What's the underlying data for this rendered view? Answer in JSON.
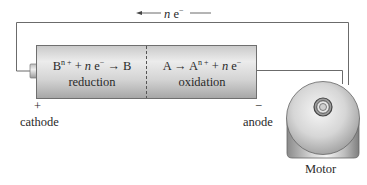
{
  "electron_flow": {
    "label_n": "n",
    "label_e": "e",
    "label_sup": "−",
    "direction": "right-to-left"
  },
  "battery": {
    "cathode_half": {
      "equation": {
        "species": "B",
        "charge_sup": "n +",
        "plus": "+",
        "n": "n",
        "e": "e",
        "e_sup": "−",
        "product": "B"
      },
      "process": "reduction"
    },
    "anode_half": {
      "equation": {
        "reactant": "A",
        "product": "A",
        "charge_sup": "n +",
        "plus": "+",
        "n": "n",
        "e": "e",
        "e_sup": "−"
      },
      "process": "oxidation"
    }
  },
  "terminals": {
    "cathode": {
      "sign": "+",
      "label": "cathode"
    },
    "anode": {
      "sign": "−",
      "label": "anode"
    }
  },
  "motor": {
    "label": "Motor"
  },
  "colors": {
    "wire": "#6b6b6b",
    "battery_light": "#e4e4e4",
    "battery_dark": "#a9a9a9",
    "motor_light": "#efefef",
    "motor_dark": "#8e8e8e",
    "text": "#2a2a2a"
  }
}
